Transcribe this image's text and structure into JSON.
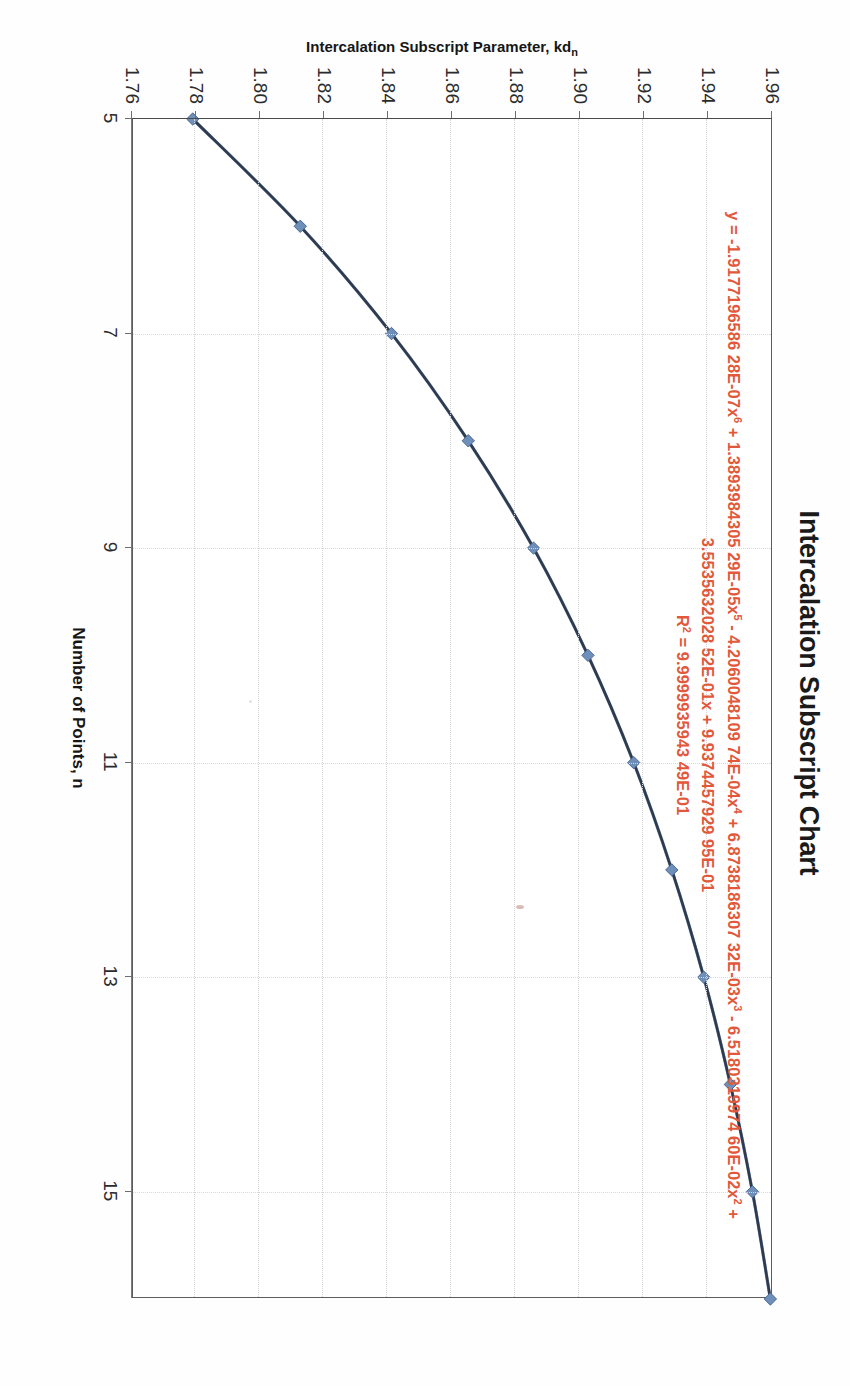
{
  "title": "Intercalation Subscript Chart",
  "axes": {
    "x_title": "Number of Points, n",
    "y_title_main": "Intercalation Subscript Parameter, kd",
    "y_title_sub": "n"
  },
  "trendline": {
    "color": "#e2583b",
    "line1": "y = -1.9177196586 28E-07x⁶ + 1.3893984305 29E-05x⁵ - 4.2060048109 74E-04x⁴ + 6.8738186307 32E-03x³ - 6.5180319974 60E-02x² +",
    "line2": "3.5535632028 52E-01x + 9.9374457929 95E-01",
    "line3": "R² = 9.9999935943 49E-01",
    "equation_full": "y = -1.917719658628E-07x^6 + 1.389398430529E-05x^5 - 4.206004810974E-04x^4 + 6.873818630732E-03x^3 - 6.518031997460E-02x^2 + 3.553563202852E-01x + 9.937445792995E-01",
    "r_squared": "9.999993594349E-01"
  },
  "chart_data": {
    "type": "line",
    "title": "Intercalation Subscript Chart",
    "subtitle": "",
    "xlabel": "Number of Points, n",
    "ylabel": "Intercalation Subscript Parameter, kd_n",
    "xlim": [
      5,
      16
    ],
    "ylim": [
      1.76,
      1.96
    ],
    "grid": true,
    "legend_position": "none",
    "xticks": [
      5,
      7,
      9,
      11,
      13,
      15
    ],
    "xtick_labels": [
      "5",
      "7",
      "9",
      "11",
      "13",
      "15"
    ],
    "yticks": [
      1.76,
      1.78,
      1.8,
      1.82,
      1.84,
      1.86,
      1.88,
      1.9,
      1.92,
      1.94,
      1.96
    ],
    "ytick_labels": [
      "1.76",
      "1.78",
      "1.80",
      "1.82",
      "1.84",
      "1.86",
      "1.88",
      "1.90",
      "1.92",
      "1.94",
      "1.96"
    ],
    "marker": "diamond",
    "marker_color": "#6e8fba",
    "line_color": "#5b7ba6",
    "trend_color": "#2f3b4d",
    "series": [
      {
        "name": "Intercalation Subscript Parameter",
        "x": [
          5,
          6,
          7,
          8,
          9,
          10,
          11,
          12,
          13,
          14,
          15,
          16
        ],
        "values": [
          1.7793,
          1.8129,
          1.8414,
          1.8654,
          1.8858,
          1.9028,
          1.9171,
          1.929,
          1.939,
          1.9473,
          1.9542,
          1.9598
        ]
      }
    ],
    "annotations": [
      {
        "text": "y = -1.917719658628E-07x^6 + 1.389398430529E-05x^5 - 4.206004810974E-04x^4 + 6.873818630732E-03x^3 - 6.518031997460E-02x^2 + 3.553563202852E-01x + 9.937445792995E-01",
        "color": "#e2583b"
      },
      {
        "text": "R^2 = 9.999993594349E-01",
        "color": "#e2583b"
      }
    ]
  }
}
